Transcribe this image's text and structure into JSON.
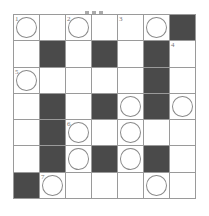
{
  "puzzle": {
    "type": "crossword",
    "rows": 7,
    "cols": 7,
    "colors": {
      "block": "#4a4a4a",
      "line": "#9a9a9a",
      "circle": "#8a8a8a",
      "background": "#ffffff"
    },
    "grid": [
      [
        {
          "t": "c",
          "n": "1"
        },
        {
          "t": "w"
        },
        {
          "t": "c",
          "n": "2"
        },
        {
          "t": "w"
        },
        {
          "t": "w",
          "n": "3"
        },
        {
          "t": "c"
        },
        {
          "t": "b"
        }
      ],
      [
        {
          "t": "w"
        },
        {
          "t": "b"
        },
        {
          "t": "w"
        },
        {
          "t": "b"
        },
        {
          "t": "w"
        },
        {
          "t": "b"
        },
        {
          "t": "w",
          "n": "4"
        }
      ],
      [
        {
          "t": "c",
          "n": "5"
        },
        {
          "t": "w"
        },
        {
          "t": "w"
        },
        {
          "t": "w"
        },
        {
          "t": "w"
        },
        {
          "t": "b"
        },
        {
          "t": "w"
        }
      ],
      [
        {
          "t": "w"
        },
        {
          "t": "b"
        },
        {
          "t": "w"
        },
        {
          "t": "b"
        },
        {
          "t": "c"
        },
        {
          "t": "b"
        },
        {
          "t": "c"
        }
      ],
      [
        {
          "t": "w"
        },
        {
          "t": "b"
        },
        {
          "t": "c",
          "n": "6"
        },
        {
          "t": "w"
        },
        {
          "t": "c"
        },
        {
          "t": "w"
        },
        {
          "t": "w"
        }
      ],
      [
        {
          "t": "w"
        },
        {
          "t": "b"
        },
        {
          "t": "c"
        },
        {
          "t": "b"
        },
        {
          "t": "c"
        },
        {
          "t": "b"
        },
        {
          "t": "w"
        }
      ],
      [
        {
          "t": "b"
        },
        {
          "t": "c",
          "n": "7"
        },
        {
          "t": "w"
        },
        {
          "t": "w"
        },
        {
          "t": "w"
        },
        {
          "t": "c"
        },
        {
          "t": "w"
        }
      ]
    ]
  }
}
